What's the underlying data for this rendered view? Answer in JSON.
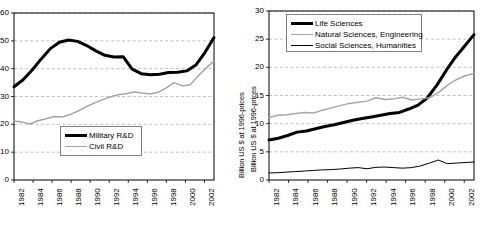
{
  "figure": {
    "panels": [
      "left",
      "right"
    ]
  },
  "chart_data": [
    {
      "id": "left",
      "type": "line",
      "title": "",
      "xlabel": "",
      "ylabel": "Billion US $ at 1996-prices",
      "xlim": [
        1982,
        2003
      ],
      "ylim": [
        0,
        60
      ],
      "yticks": [
        0,
        10,
        20,
        30,
        40,
        50,
        60
      ],
      "xticks": [
        1982,
        1984,
        1986,
        1988,
        1990,
        1992,
        1994,
        1996,
        1998,
        2000,
        2002
      ],
      "grid": "horizontal-dashed",
      "legend_position": "center-left",
      "x": [
        1982,
        1983,
        1984,
        1985,
        1986,
        1987,
        1988,
        1989,
        1990,
        1991,
        1992,
        1993,
        1994,
        1995,
        1996,
        1997,
        1998,
        1999,
        2000,
        2001,
        2002,
        2003
      ],
      "series": [
        {
          "name": "Military R&D",
          "color": "#000000",
          "style": "thick",
          "values": [
            33.5,
            36.0,
            39.5,
            43.5,
            47.2,
            49.5,
            50.3,
            49.8,
            48.3,
            46.4,
            44.8,
            44.2,
            44.3,
            39.8,
            38.2,
            37.8,
            38.0,
            38.6,
            38.7,
            39.2,
            41.3,
            45.8,
            51.2
          ]
        },
        {
          "name": "Civil R&D",
          "color": "#a6a6a6",
          "style": "medium",
          "values": [
            21.2,
            20.8,
            20.1,
            21.3,
            22.0,
            22.8,
            22.6,
            23.5,
            24.8,
            26.3,
            27.6,
            28.8,
            29.8,
            30.6,
            31.0,
            31.6,
            31.3,
            30.9,
            31.5,
            33.0,
            35.0,
            33.9,
            34.1,
            37.3,
            40.2,
            42.8
          ]
        }
      ]
    },
    {
      "id": "right",
      "type": "line",
      "title": "",
      "xlabel": "",
      "ylabel": "Billion US $ at 1996-prices",
      "xlim": [
        1982,
        2003
      ],
      "ylim": [
        0,
        30
      ],
      "yticks": [
        0,
        5,
        10,
        15,
        20,
        25,
        30
      ],
      "xticks": [
        1982,
        1984,
        1986,
        1988,
        1990,
        1992,
        1994,
        1996,
        1998,
        2000,
        2002
      ],
      "grid": "horizontal-dashed",
      "legend_position": "upper-left",
      "x": [
        1982,
        1983,
        1984,
        1985,
        1986,
        1987,
        1988,
        1989,
        1990,
        1991,
        1992,
        1993,
        1994,
        1995,
        1996,
        1997,
        1998,
        1999,
        2000,
        2001,
        2002,
        2003
      ],
      "series": [
        {
          "name": "Life Sciences",
          "color": "#000000",
          "style": "thick",
          "values": [
            7.1,
            7.4,
            7.9,
            8.5,
            8.7,
            9.1,
            9.5,
            9.8,
            10.2,
            10.6,
            10.9,
            11.2,
            11.5,
            11.8,
            12.0,
            12.6,
            13.3,
            14.6,
            16.8,
            19.4,
            21.8,
            23.8,
            25.8
          ]
        },
        {
          "name": "Natural Sciences, Engineering",
          "color": "#a6a6a6",
          "style": "medium",
          "values": [
            11.1,
            11.5,
            11.6,
            11.8,
            12.0,
            11.9,
            12.4,
            12.8,
            13.2,
            13.6,
            13.8,
            14.0,
            14.6,
            14.3,
            14.4,
            14.7,
            14.2,
            14.4,
            14.6,
            15.5,
            16.8,
            17.8,
            18.5,
            18.9
          ]
        },
        {
          "name": "Social Sciences, Humanities",
          "color": "#000000",
          "style": "thin",
          "values": [
            1.25,
            1.3,
            1.4,
            1.5,
            1.6,
            1.7,
            1.8,
            1.85,
            1.95,
            2.1,
            2.2,
            2.0,
            2.25,
            2.3,
            2.2,
            2.1,
            2.2,
            2.5,
            3.0,
            3.55,
            2.9,
            3.0,
            3.1,
            3.2
          ]
        }
      ]
    }
  ],
  "left_chart": {
    "ylabel": "Billion US $ at 1996-prices",
    "yticks": [
      "0",
      "10",
      "20",
      "30",
      "40",
      "50",
      "60"
    ],
    "xticks": [
      "1982",
      "1984",
      "1986",
      "1988",
      "1990",
      "1992",
      "1994",
      "1996",
      "1998",
      "2000",
      "2002"
    ],
    "legend": [
      {
        "label": "Military R&D",
        "style": "thick"
      },
      {
        "label": "Civil R&D",
        "style": "grey"
      }
    ]
  },
  "right_chart": {
    "ylabel": "Billion US $ at 1996-prices",
    "yticks": [
      "0",
      "5",
      "10",
      "15",
      "20",
      "25",
      "30"
    ],
    "xticks": [
      "1982",
      "1984",
      "1986",
      "1988",
      "1990",
      "1992",
      "1994",
      "1996",
      "1998",
      "2000",
      "2002"
    ],
    "legend": [
      {
        "label": "Life Sciences",
        "style": "thick"
      },
      {
        "label": "Natural Sciences, Engineering",
        "style": "grey"
      },
      {
        "label": "Social Sciences, Humanities",
        "style": "thin"
      }
    ]
  },
  "colors": {
    "series_dark": "#000000",
    "series_grey": "#a6a6a6",
    "axis": "#000000",
    "grid": "#b0b0b0",
    "background": "#ffffff"
  }
}
